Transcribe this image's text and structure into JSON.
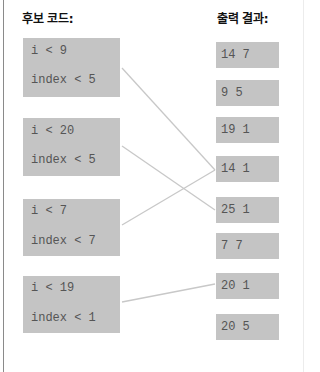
{
  "headings": {
    "candidates": "후보 코드:",
    "outputs": "출력 결과:"
  },
  "candidates": [
    {
      "line1": "i < 9",
      "line2": "index < 5"
    },
    {
      "line1": "i < 20",
      "line2": "index < 5"
    },
    {
      "line1": "i < 7",
      "line2": "index < 7"
    },
    {
      "line1": "i < 19",
      "line2": "index < 1"
    }
  ],
  "outputs": [
    "14 7",
    "9 5",
    "19 1",
    "14 1",
    "25 1",
    "7 7",
    "20 1",
    "20 5"
  ],
  "connections": [
    {
      "candidate": 0,
      "output": "14 1"
    },
    {
      "candidate": 1,
      "output": "25 1"
    },
    {
      "candidate": 2,
      "output": "14 1"
    },
    {
      "candidate": 3,
      "output": "20 1"
    }
  ],
  "colors": {
    "box": "#c4c4c4",
    "line": "#c8c8c8",
    "text": "#555555"
  }
}
